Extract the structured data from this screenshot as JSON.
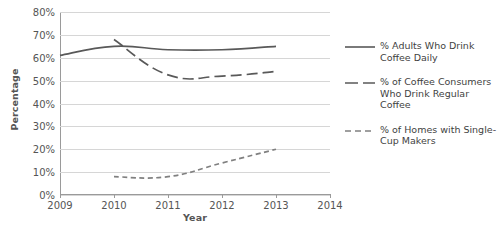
{
  "chart_data": {
    "type": "line",
    "title": "",
    "xlabel": "Year",
    "ylabel": "Percentage",
    "x": [
      2009,
      2010,
      2011,
      2012,
      2013,
      2014
    ],
    "xlim": [
      2009,
      2014
    ],
    "ylim": [
      0,
      80
    ],
    "grid": "horizontal",
    "legend_position": "right",
    "x_tick_labels": [
      "2009",
      "2010",
      "2011",
      "2012",
      "2013",
      "2014"
    ],
    "y_tick_labels": [
      "0%",
      "10%",
      "20%",
      "30%",
      "40%",
      "50%",
      "60%",
      "70%",
      "80%"
    ],
    "y_ticks": [
      0,
      10,
      20,
      30,
      40,
      50,
      60,
      70,
      80
    ],
    "series": [
      {
        "name": "% Adults Who Drink Coffee Daily",
        "style": "solid",
        "color": "#595959",
        "x": [
          2009,
          2010,
          2011,
          2012,
          2013
        ],
        "values": [
          61,
          65,
          63.5,
          63.5,
          65
        ]
      },
      {
        "name": "% of Coffee Consumers Who Drink Regular Coffee",
        "style": "long-dash",
        "color": "#595959",
        "x": [
          2010,
          2011,
          2012,
          2013
        ],
        "values": [
          68,
          52.5,
          52,
          54
        ]
      },
      {
        "name": "% of Homes with Single-Cup Makers",
        "style": "short-dash",
        "color": "#808080",
        "x": [
          2010,
          2011,
          2012,
          2013
        ],
        "values": [
          8,
          8,
          14,
          20
        ]
      }
    ]
  },
  "axes": {
    "y_title": "Percentage",
    "x_title": "Year",
    "y_labels": [
      "80%",
      "70%",
      "60%",
      "50%",
      "40%",
      "30%",
      "20%",
      "10%",
      "0%"
    ],
    "x_labels": [
      "2009",
      "2010",
      "2011",
      "2012",
      "2013",
      "2014"
    ]
  },
  "legend": {
    "entries": [
      {
        "line1": "% Adults Who Drink",
        "line2": "Coffee Daily",
        "line3": ""
      },
      {
        "line1": "% of Coffee Consumers",
        "line2": "Who Drink Regular",
        "line3": "Coffee"
      },
      {
        "line1": "% of Homes with Single-",
        "line2": "Cup Makers",
        "line3": ""
      }
    ]
  }
}
